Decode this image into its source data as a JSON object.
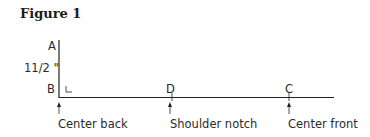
{
  "figure": {
    "title": "Figure 1",
    "points": {
      "a": "A",
      "b": "B",
      "c": "C",
      "d": "D"
    },
    "measurement": "11/2 \"",
    "labels": {
      "center_back": "Center back",
      "shoulder_notch": "Shoulder notch",
      "center_front": "Center front"
    }
  }
}
